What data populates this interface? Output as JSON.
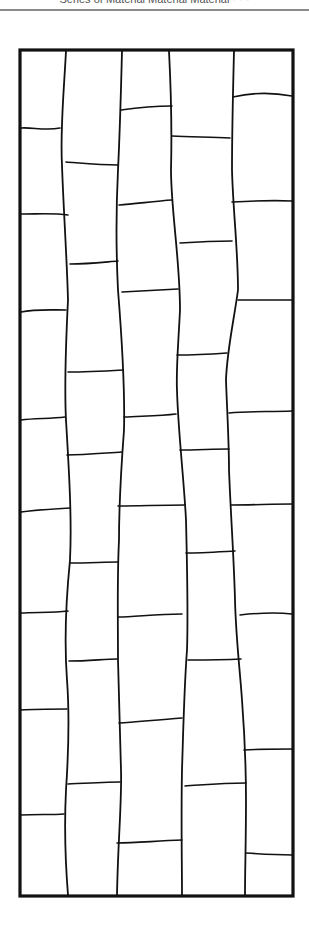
{
  "header": {
    "text": "Series of  Material Material Material   · · ·"
  },
  "colors": {
    "ink": "#111111",
    "paper": "#ffffff",
    "rule": "#8a8a8a"
  },
  "diagram": {
    "frame": {
      "x": 20,
      "y": 50,
      "width": 273,
      "height": 846,
      "stroke": 3.2
    },
    "verticals": [
      "M66,51 C64,90 60,130 62,165 C63,200 67,260 68,300 C66,340 64,380 66,420 C69,470 72,520 70,560 C66,600 64,640 67,680 C70,720 68,760 66,790 C64,830 66,870 68,895",
      "M122,51 C121,90 120,130 118,170 C116,210 116,250 118,290 C122,340 125,390 124,430 C121,470 119,510 119,540 C117,580 118,620 118,660 C119,700 120,740 121,770 C122,800 118,840 117,895",
      "M169,51 C171,90 172,130 171,170 C171,210 180,260 180,310 C178,350 176,370 177,390 C178,430 184,480 186,520 C187,560 188,620 187,650 C184,690 183,740 182,770 C181,820 182,860 182,895",
      "M234,51 C233,90 232,130 232,170 C233,210 238,250 238,290 C234,320 227,350 226,380 C227,410 229,440 229,470 C231,520 234,560 235,600 C236,640 240,670 242,700 C245,740 246,770 246,800 C246,840 245,870 245,895"
    ],
    "horizontals": [
      "M21,128 C32,127 45,131 60,128",
      "M21,214 C40,214 55,213 68,215",
      "M21,312 C35,309 50,310 66,310",
      "M21,420 C35,418 50,419 65,417",
      "M21,512 C35,510 52,509 70,508",
      "M21,613 C35,612 52,613 68,611",
      "M21,710 C35,709 52,709 67,709",
      "M21,815 C35,814 52,815 64,814",
      "M66,162 C80,163 100,165 118,165",
      "M70,264 C88,264 105,262 118,261",
      "M68,372 C85,372 105,371 123,370",
      "M67,455 C85,455 105,453 122,452",
      "M70,563 C88,563 105,562 118,562",
      "M69,661 C88,661 105,659 117,659",
      "M68,784 C88,783 105,782 120,782",
      "M121,110 C135,108 155,106 172,106",
      "M119,205 C135,204 155,201 172,200",
      "M122,292 C140,291 160,290 178,289",
      "M124,417 C140,416 160,416 176,414",
      "M118,506 C140,506 160,505 185,505",
      "M118,617 C135,617 155,614 182,614",
      "M119,723 C135,722 155,720 182,718",
      "M117,843 C135,843 155,841 182,840",
      "M172,136 C190,137 210,137 230,138",
      "M180,243 C195,242 215,241 232,241",
      "M177,355 C192,355 212,354 227,353",
      "M180,450 C196,450 214,449 229,449",
      "M186,553 C200,553 216,552 235,551",
      "M188,660 C205,660 222,660 241,659",
      "M185,786 C202,785 220,783 246,783",
      "M233,97 C250,93 270,92 292,96",
      "M232,202 C250,201 270,200 292,201",
      "M238,300 C255,300 275,300 292,300",
      "M229,413 C250,411 270,412 292,411",
      "M231,505 C252,505 272,504 292,504",
      "M240,615 C258,613 275,612 292,614",
      "M244,750 C258,749 275,749 292,749",
      "M246,853 C260,854 278,855 292,855"
    ]
  }
}
